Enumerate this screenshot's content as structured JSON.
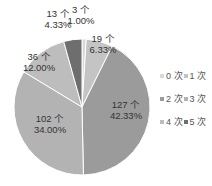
{
  "chart_data": {
    "type": "pie",
    "title": "",
    "categories": [
      "0 次",
      "1 次",
      "2 次",
      "3 次",
      "4 次",
      "5 次"
    ],
    "values": [
      3,
      19,
      127,
      102,
      36,
      13
    ],
    "percentages": [
      "1.00%",
      "6.33%",
      "42.33%",
      "34.00%",
      "12.00%",
      "4.33%"
    ],
    "counts_labels": [
      "3 个",
      "19 个",
      "127 个",
      "102 个",
      "36 个",
      "13 个"
    ],
    "colors": [
      "#d9d9d9",
      "#c4c4c4",
      "#9b9b9b",
      "#b3b3b3",
      "#bdbdbd",
      "#6e6e6e"
    ],
    "legend_position": "right",
    "total": 300
  },
  "legend": {
    "rows": [
      [
        {
          "label": "0 次",
          "color": "#d9d9d9"
        },
        {
          "label": "1 次",
          "color": "#c4c4c4"
        }
      ],
      [
        {
          "label": "2 次",
          "color": "#9b9b9b"
        },
        {
          "label": "3 次",
          "color": "#b3b3b3"
        }
      ],
      [
        {
          "label": "4 次",
          "color": "#bdbdbd"
        },
        {
          "label": "5 次",
          "color": "#6e6e6e"
        }
      ]
    ]
  }
}
